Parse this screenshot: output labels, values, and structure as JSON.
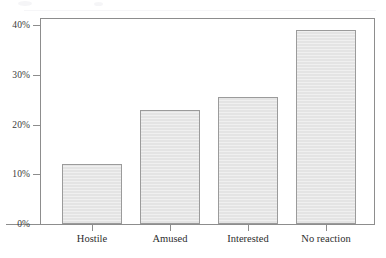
{
  "chart_data": {
    "type": "bar",
    "title": "",
    "subtitle": "",
    "xlabel": "",
    "ylabel": "",
    "categories": [
      "Hostile",
      "Amused",
      "Interested",
      "No reaction"
    ],
    "values": [
      12,
      23,
      25.5,
      39
    ],
    "value_labels": [
      "12%",
      "23%",
      "25.5%",
      "39%"
    ],
    "ylim": [
      0,
      42
    ],
    "yticks": [
      0,
      10,
      20,
      30,
      40
    ],
    "ytick_labels": [
      "0%",
      "10%",
      "20%",
      "30%",
      "40%"
    ],
    "grid": false,
    "legend": null,
    "series": [
      {
        "name": "Reaction",
        "values": [
          12,
          23,
          25.5,
          39
        ]
      }
    ],
    "colors": {
      "bar_fill": "#e4e4e4",
      "bar_border": "#9b9b9b",
      "axis": "#8d8d8d",
      "text": "#2e2e2e",
      "background": "#ffffff"
    }
  }
}
